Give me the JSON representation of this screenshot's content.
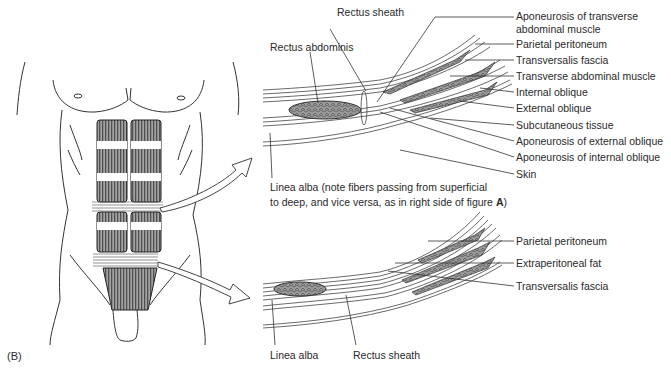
{
  "figure_label": "(B)",
  "upper_section": {
    "left_labels": {
      "rectus_sheath": "Rectus sheath",
      "rectus_abdominis": "Rectus abdominis"
    },
    "right_labels": [
      {
        "line1": "Aponeurosis of transverse",
        "line2": "abdominal muscle"
      },
      {
        "line1": "Parietal peritoneum"
      },
      {
        "line1": "Transversalis fascia"
      },
      {
        "line1": "Transverse abdominal muscle"
      },
      {
        "line1": "Internal oblique"
      },
      {
        "line1": "External oblique"
      },
      {
        "line1": "Subcutaneous tissue"
      },
      {
        "line1": "Aponeurosis of external oblique"
      },
      {
        "line1": "Aponeurosis of internal oblique"
      },
      {
        "line1": "Skin"
      }
    ],
    "caption": {
      "line1": "Linea alba (note fibers passing from superficial",
      "line2_prefix": "to deep, and vice versa, as in right side of figure ",
      "line2_bold": "A",
      "line2_suffix": ")"
    }
  },
  "lower_section": {
    "right_labels": [
      {
        "line1": "Parietal peritoneum"
      },
      {
        "line1": "Extraperitoneal fat"
      },
      {
        "line1": "Transversalis fascia"
      }
    ],
    "bottom_labels": {
      "linea_alba": "Linea alba",
      "rectus_sheath": "Rectus sheath"
    }
  },
  "colors": {
    "line": "#3a3a3a",
    "muscle_fill": "#8a8a8a",
    "arrow_fill": "#ffffff"
  }
}
